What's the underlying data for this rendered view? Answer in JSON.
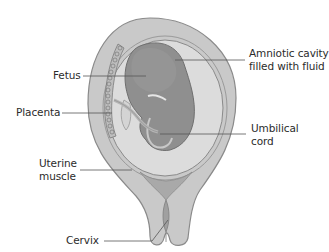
{
  "diagram": {
    "type": "anatomical-illustration",
    "labels": {
      "fetus": {
        "text": "Fetus"
      },
      "placenta": {
        "text": "Placenta"
      },
      "amniotic": {
        "line1": "Amniotic cavity",
        "line2": "filled with fluid"
      },
      "umbilical": {
        "line1": "Umbilical",
        "line2": "cord"
      },
      "uterine": {
        "line1": "Uterine",
        "line2": "muscle"
      },
      "cervix": {
        "text": "Cervix"
      }
    },
    "colors": {
      "uterine_wall": "#c9c9c9",
      "uterine_outline": "#8a8a8a",
      "amniotic_fluid": "#dcdcdc",
      "sac_membrane": "#9a9a9a",
      "fetus": "#8f8f8f",
      "fetus_outline": "#6f6f6f",
      "placenta": "#bdbdbd",
      "leader_line": "#555555",
      "text": "#2b2b2b",
      "background": "#ffffff"
    }
  }
}
